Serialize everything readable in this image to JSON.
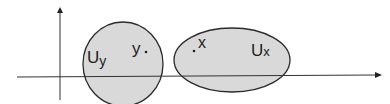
{
  "diagram": {
    "neighborhoods": [
      {
        "label_main": "U",
        "label_sub": "y",
        "point_label": "y"
      },
      {
        "label_main": "U",
        "label_sub": "x",
        "point_label": "x"
      }
    ],
    "colors": {
      "fill": "#d9d9d9",
      "stroke": "#2a2a2a",
      "axis": "#333333"
    }
  }
}
